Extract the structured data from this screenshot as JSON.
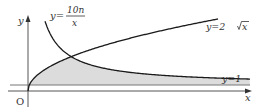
{
  "diagram": {
    "axis_labels": {
      "x": "x",
      "y": "y",
      "origin": "O"
    },
    "curves": [
      {
        "name": "hyperbola",
        "label_prefix": "y=",
        "numerator": "10n",
        "denominator": "x"
      },
      {
        "name": "sqrt",
        "label": "y=2√x",
        "label_lhs": "y=2",
        "label_radicand": "x"
      },
      {
        "name": "horizontal",
        "label": "y=1"
      }
    ],
    "shaded_region": "area between y=1, y=2√x and y=10n/x",
    "colors": {
      "curve": "#1a1a1a",
      "axis": "#555555",
      "shade": "#d9d9d9",
      "line_y1": "#777777"
    }
  }
}
